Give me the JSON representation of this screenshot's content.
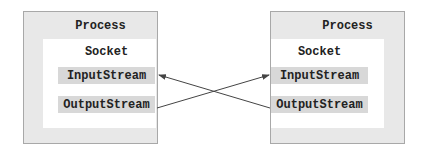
{
  "diagram": {
    "left_process": {
      "title": "Process",
      "socket": {
        "title": "Socket",
        "input_stream": "InputStream",
        "output_stream": "OutputStream"
      }
    },
    "right_process": {
      "title": "Process",
      "socket": {
        "title": "Socket",
        "input_stream": "InputStream",
        "output_stream": "OutputStream"
      }
    },
    "connections": [
      {
        "from": "right_process.output_stream",
        "to": "left_process.input_stream"
      },
      {
        "from": "left_process.output_stream",
        "to": "right_process.input_stream"
      }
    ],
    "colors": {
      "process_fill": "#e8e8e8",
      "process_border": "#a8a8a8",
      "socket_fill": "#ffffff",
      "stream_fill": "#d8d8d8",
      "arrow": "#444444",
      "text": "#222222"
    }
  }
}
